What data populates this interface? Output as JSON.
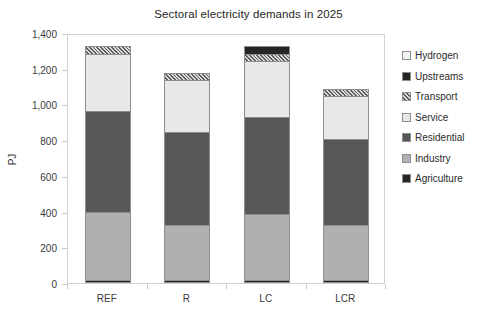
{
  "chart_data": {
    "type": "bar",
    "subtype": "stacked-column",
    "title": "Sectoral electricity demands in 2025",
    "xlabel": "",
    "ylabel": "PJ",
    "categories": [
      "REF",
      "R",
      "LC",
      "LCR"
    ],
    "ylim": [
      0,
      1400
    ],
    "ytick_step": 200,
    "ytick_labels": [
      "0",
      "200",
      "400",
      "600",
      "800",
      "1,000",
      "1,200",
      "1,400"
    ],
    "ytick_values": [
      0,
      200,
      400,
      600,
      800,
      1000,
      1200,
      1400
    ],
    "grid": false,
    "legend_position": "right",
    "stack_order_bottom_to_top": [
      "Agriculture",
      "Industry",
      "Residential",
      "Service",
      "Transport",
      "Upstreams",
      "Hydrogen"
    ],
    "series": [
      {
        "name": "Agriculture",
        "color": "#262626",
        "pattern": "solid",
        "values": [
          15,
          15,
          15,
          15
        ]
      },
      {
        "name": "Industry",
        "color": "#b0b0b0",
        "pattern": "solid",
        "values": [
          385,
          310,
          370,
          310
        ]
      },
      {
        "name": "Residential",
        "color": "#575757",
        "pattern": "solid",
        "values": [
          565,
          520,
          545,
          480
        ]
      },
      {
        "name": "Service",
        "color": "#e8e8e8",
        "pattern": "solid",
        "values": [
          320,
          290,
          315,
          240
        ]
      },
      {
        "name": "Transport",
        "color": "#dcdcdc",
        "pattern": "hatch",
        "values": [
          40,
          40,
          40,
          40
        ]
      },
      {
        "name": "Upstreams",
        "color": "#262626",
        "pattern": "solid",
        "values": [
          0,
          0,
          40,
          0
        ]
      },
      {
        "name": "Hydrogen",
        "color": "#f2f2f2",
        "pattern": "solid",
        "values": [
          0,
          0,
          0,
          0
        ]
      }
    ],
    "totals": [
      1325,
      1175,
      1325,
      1085
    ],
    "annotations": []
  },
  "legend": {
    "items": [
      {
        "label": "Hydrogen",
        "swatch": "legend-swatch-hydrogen"
      },
      {
        "label": "Upstreams",
        "swatch": "legend-swatch-upstreams"
      },
      {
        "label": "Transport",
        "swatch": "legend-swatch-transport"
      },
      {
        "label": "Service",
        "swatch": "legend-swatch-service"
      },
      {
        "label": "Residential",
        "swatch": "legend-swatch-residential"
      },
      {
        "label": "Industry",
        "swatch": "legend-swatch-industry"
      },
      {
        "label": "Agriculture",
        "swatch": "legend-swatch-agriculture"
      }
    ]
  },
  "colors": {
    "hydrogen": "#f2f2f2",
    "upstreams": "#262626",
    "transport": "#dcdcdc",
    "service": "#e8e8e8",
    "residential": "#575757",
    "industry": "#b0b0b0",
    "agriculture": "#262626",
    "outline": "#8e8e8e",
    "frame": "#d2d2d2",
    "text": "#2b2b2b"
  }
}
